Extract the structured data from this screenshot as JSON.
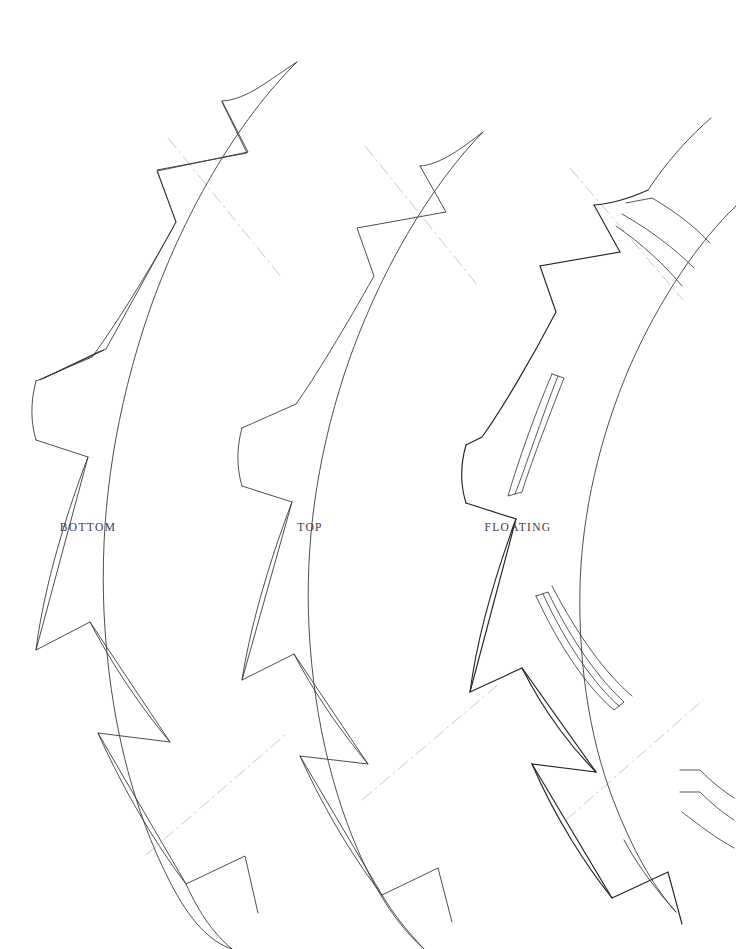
{
  "sheet": {
    "width": 736,
    "height": 949,
    "background_color": "#ffffff",
    "line_color": "#3a3a3a",
    "heavy_line_color": "#232323",
    "construction_line_color": "#c2c2c2",
    "label_color": "#3b3b3b",
    "drawing_type": "line-drawing",
    "description": "Three concentric curved arc band segments with sawtooth notched inner edges"
  },
  "parts": [
    {
      "id": "bottom",
      "label": "BOTTOM",
      "label_x": 88,
      "label_y": 527,
      "inner_radius": 330,
      "outer_radius": 455,
      "tooth_count": 5,
      "has_slots": false,
      "stroke_weight": 0.9
    },
    {
      "id": "top",
      "label": "TOP",
      "label_x": 310,
      "label_y": 527,
      "inner_radius": 550,
      "outer_radius": 675,
      "tooth_count": 5,
      "has_slots": false,
      "stroke_weight": 0.9
    },
    {
      "id": "floating",
      "label": "FLOATING",
      "label_x": 518,
      "label_y": 527,
      "inner_radius": 770,
      "outer_radius": 895,
      "tooth_count": 5,
      "has_slots": true,
      "slot_count": 3,
      "stroke_weight": 1.15
    }
  ],
  "construction_lines": {
    "style": "dash-dot",
    "color": "#c2c2c2",
    "count": 6,
    "marks": [
      {
        "id": "cl-top-1",
        "x": 222,
        "y": 205,
        "angle": 52
      },
      {
        "id": "cl-top-2",
        "x": 418,
        "y": 212,
        "angle": 52
      },
      {
        "id": "cl-top-3",
        "x": 622,
        "y": 232,
        "angle": 52
      },
      {
        "id": "cl-bottom-1",
        "x": 212,
        "y": 800,
        "angle": -50
      },
      {
        "id": "cl-bottom-2",
        "x": 430,
        "y": 742,
        "angle": -50
      },
      {
        "id": "cl-bottom-3",
        "x": 632,
        "y": 760,
        "angle": -50
      }
    ]
  },
  "arc_geometry": {
    "center_x": 1258,
    "center_y": 474,
    "angle_start_deg": -22.5,
    "angle_end_deg": 22.5,
    "note": "Arc center lies far to the right of the sheet; all three bands are concentric."
  }
}
